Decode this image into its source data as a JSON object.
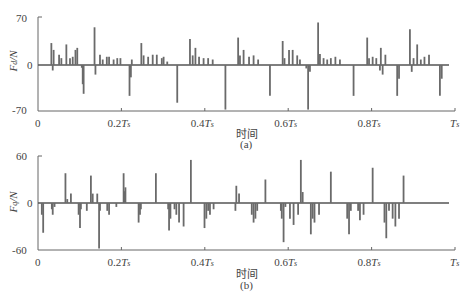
{
  "chart_data": [
    {
      "type": "bar",
      "panel": "a",
      "caption": "(a)",
      "xlabel": "时间",
      "ylabel": "F_d/N",
      "ylabel_main": "F",
      "ylabel_sub": "d",
      "ylabel_unit": "/N",
      "ylim": [
        -70,
        70
      ],
      "yticks": [
        "70",
        "0",
        "-70"
      ],
      "xticks": [
        "0",
        "0.2T",
        "0.4T",
        "0.6T",
        "0.8T",
        "T"
      ],
      "xtick_sub": "s",
      "grid": false,
      "spikes": [
        [
          0.025,
          32
        ],
        [
          0.028,
          -8
        ],
        [
          0.03,
          22
        ],
        [
          0.042,
          15
        ],
        [
          0.047,
          10
        ],
        [
          0.058,
          30
        ],
        [
          0.066,
          10
        ],
        [
          0.072,
          12
        ],
        [
          0.078,
          22
        ],
        [
          0.082,
          25
        ],
        [
          0.092,
          -4
        ],
        [
          0.094,
          -28
        ],
        [
          0.096,
          -42
        ],
        [
          0.12,
          55
        ],
        [
          0.122,
          -14
        ],
        [
          0.132,
          15
        ],
        [
          0.138,
          8
        ],
        [
          0.147,
          12
        ],
        [
          0.152,
          12
        ],
        [
          0.162,
          8
        ],
        [
          0.17,
          10
        ],
        [
          0.177,
          10
        ],
        [
          0.197,
          -45
        ],
        [
          0.2,
          -18
        ],
        [
          0.202,
          8
        ],
        [
          0.223,
          32
        ],
        [
          0.228,
          14
        ],
        [
          0.238,
          12
        ],
        [
          0.248,
          15
        ],
        [
          0.257,
          15
        ],
        [
          0.268,
          10
        ],
        [
          0.272,
          12
        ],
        [
          0.28,
          5
        ],
        [
          0.302,
          -55
        ],
        [
          0.33,
          38
        ],
        [
          0.336,
          14
        ],
        [
          0.342,
          25
        ],
        [
          0.35,
          12
        ],
        [
          0.36,
          10
        ],
        [
          0.37,
          10
        ],
        [
          0.38,
          8
        ],
        [
          0.408,
          -65
        ],
        [
          0.436,
          40
        ],
        [
          0.44,
          14
        ],
        [
          0.448,
          22
        ],
        [
          0.46,
          12
        ],
        [
          0.47,
          14
        ],
        [
          0.48,
          8
        ],
        [
          0.506,
          -45
        ],
        [
          0.534,
          35
        ],
        [
          0.538,
          10
        ],
        [
          0.548,
          22
        ],
        [
          0.556,
          22
        ],
        [
          0.566,
          14
        ],
        [
          0.572,
          8
        ],
        [
          0.586,
          -5
        ],
        [
          0.59,
          -65
        ],
        [
          0.594,
          -10
        ],
        [
          0.612,
          62
        ],
        [
          0.616,
          16
        ],
        [
          0.624,
          10
        ],
        [
          0.632,
          8
        ],
        [
          0.64,
          10
        ],
        [
          0.65,
          12
        ],
        [
          0.66,
          8
        ],
        [
          0.69,
          -45
        ],
        [
          0.72,
          40
        ],
        [
          0.724,
          10
        ],
        [
          0.732,
          12
        ],
        [
          0.74,
          10
        ],
        [
          0.748,
          -8
        ],
        [
          0.75,
          25
        ],
        [
          0.754,
          -14
        ],
        [
          0.76,
          15
        ],
        [
          0.786,
          -45
        ],
        [
          0.79,
          -20
        ],
        [
          0.814,
          52
        ],
        [
          0.818,
          -10
        ],
        [
          0.822,
          10
        ],
        [
          0.83,
          30
        ],
        [
          0.838,
          8
        ],
        [
          0.846,
          12
        ],
        [
          0.856,
          15
        ],
        [
          0.88,
          -45
        ],
        [
          0.884,
          -20
        ]
      ]
    },
    {
      "type": "bar",
      "panel": "b",
      "caption": "(b)",
      "xlabel": "时间",
      "ylabel": "F_q/N",
      "ylabel_main": "F",
      "ylabel_sub": "q",
      "ylabel_unit": "/N",
      "ylim": [
        -60,
        60
      ],
      "yticks": [
        "60",
        "0",
        "-60"
      ],
      "xticks": [
        "0",
        "0.2T",
        "0.4T",
        "0.6T",
        "0.8T",
        "T"
      ],
      "xtick_sub": "s",
      "grid": false,
      "spikes": [
        [
          0.004,
          -15
        ],
        [
          0.007,
          -38
        ],
        [
          0.026,
          -8
        ],
        [
          0.028,
          -15
        ],
        [
          0.032,
          -5
        ],
        [
          0.056,
          38
        ],
        [
          0.06,
          5
        ],
        [
          0.068,
          12
        ],
        [
          0.085,
          -15
        ],
        [
          0.088,
          -32
        ],
        [
          0.09,
          -8
        ],
        [
          0.103,
          -10
        ],
        [
          0.112,
          35
        ],
        [
          0.116,
          12
        ],
        [
          0.126,
          12
        ],
        [
          0.13,
          -58
        ],
        [
          0.132,
          -10
        ],
        [
          0.148,
          -10
        ],
        [
          0.152,
          -15
        ],
        [
          0.168,
          -5
        ],
        [
          0.184,
          38
        ],
        [
          0.186,
          15
        ],
        [
          0.188,
          20
        ],
        [
          0.217,
          -25
        ],
        [
          0.22,
          -15
        ],
        [
          0.222,
          -8
        ],
        [
          0.255,
          38
        ],
        [
          0.282,
          -8
        ],
        [
          0.284,
          -35
        ],
        [
          0.287,
          -20
        ],
        [
          0.296,
          -8
        ],
        [
          0.3,
          -15
        ],
        [
          0.306,
          -25
        ],
        [
          0.316,
          -30
        ],
        [
          0.332,
          55
        ],
        [
          0.362,
          -32
        ],
        [
          0.366,
          -20
        ],
        [
          0.37,
          -10
        ],
        [
          0.374,
          -15
        ],
        [
          0.382,
          -8
        ],
        [
          0.43,
          -10
        ],
        [
          0.432,
          22
        ],
        [
          0.438,
          12
        ],
        [
          0.466,
          -15
        ],
        [
          0.47,
          -25
        ],
        [
          0.474,
          -20
        ],
        [
          0.478,
          -10
        ],
        [
          0.496,
          30
        ],
        [
          0.53,
          -10
        ],
        [
          0.532,
          -20
        ],
        [
          0.536,
          -50
        ],
        [
          0.54,
          -5
        ],
        [
          0.55,
          -20
        ],
        [
          0.558,
          -28
        ],
        [
          0.568,
          -15
        ],
        [
          0.574,
          55
        ],
        [
          0.578,
          14
        ],
        [
          0.596,
          -40
        ],
        [
          0.6,
          -20
        ],
        [
          0.604,
          -25
        ],
        [
          0.614,
          -15
        ],
        [
          0.64,
          40
        ],
        [
          0.676,
          -20
        ],
        [
          0.68,
          -40
        ],
        [
          0.684,
          -10
        ],
        [
          0.7,
          -10
        ],
        [
          0.704,
          -22
        ],
        [
          0.712,
          -15
        ],
        [
          0.732,
          45
        ],
        [
          0.758,
          -25
        ],
        [
          0.762,
          -45
        ],
        [
          0.768,
          -10
        ],
        [
          0.776,
          -20
        ],
        [
          0.782,
          -30
        ],
        [
          0.79,
          -20
        ],
        [
          0.8,
          35
        ]
      ]
    }
  ]
}
